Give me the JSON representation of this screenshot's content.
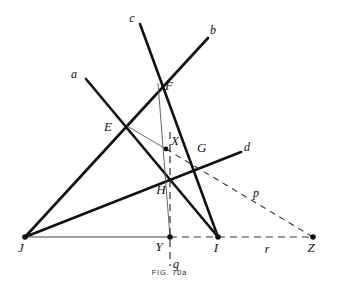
{
  "figure": {
    "caption": "FIG. 70a",
    "stroke_thick": "#111111",
    "stroke_thin": "#444444",
    "stroke_dashed": "#333333",
    "background": "#ffffff"
  },
  "points": {
    "E": {
      "label": "E",
      "x": 127,
      "y": 126,
      "label_x": 108,
      "label_y": 131,
      "dot": false
    },
    "F": {
      "label": "F",
      "x": 158,
      "y": 83,
      "label_x": 165,
      "label_y": 90,
      "dot": false
    },
    "G": {
      "label": "G",
      "x": 192,
      "y": 157,
      "label_x": 197,
      "label_y": 152,
      "dot": false
    },
    "H": {
      "label": "H",
      "x": 170,
      "y": 178,
      "label_x": 161,
      "label_y": 194,
      "dot": false
    },
    "X": {
      "label": "X",
      "x": 166,
      "y": 149,
      "label_x": 171,
      "label_y": 145,
      "dot": true
    },
    "Y": {
      "label": "Y",
      "x": 170,
      "y": 237,
      "label_x": 159,
      "label_y": 251,
      "dot": true
    },
    "I": {
      "label": "I",
      "x": 218,
      "y": 237,
      "label_x": 214,
      "label_y": 252,
      "dot": true
    },
    "J": {
      "label": "J",
      "x": 25,
      "y": 237,
      "label_x": 19,
      "label_y": 252,
      "dot": true
    },
    "Z": {
      "label": "Z",
      "x": 313,
      "y": 237,
      "label_x": 307,
      "label_y": 252,
      "dot": true
    }
  },
  "line_labels": {
    "a": {
      "label": "a",
      "x": 74,
      "y": 78
    },
    "b": {
      "label": "b",
      "x": 211,
      "y": 34
    },
    "c": {
      "label": "c",
      "x": 132,
      "y": 22
    },
    "d": {
      "label": "d",
      "x": 245,
      "y": 151
    },
    "p": {
      "label": "p",
      "x": 254,
      "y": 196
    },
    "q": {
      "label": "q",
      "x": 173,
      "y": 268
    },
    "r": {
      "label": "r",
      "x": 267,
      "y": 253
    }
  },
  "segments": {
    "line_a": {
      "name": "a",
      "x1": 86,
      "y1": 79,
      "x2": 218,
      "y2": 237,
      "width": 2.6,
      "dashed": false
    },
    "line_b": {
      "name": "b",
      "x1": 25,
      "y1": 237,
      "x2": 208,
      "y2": 38,
      "width": 2.6,
      "dashed": false
    },
    "line_c": {
      "name": "c",
      "x1": 140,
      "y1": 24,
      "x2": 218,
      "y2": 237,
      "width": 2.6,
      "dashed": false
    },
    "line_d": {
      "name": "d",
      "x1": 25,
      "y1": 237,
      "x2": 241,
      "y2": 152,
      "width": 2.6,
      "dashed": false
    },
    "seg_FY": {
      "name": "F-Y thin",
      "x1": 158,
      "y1": 83,
      "x2": 170,
      "y2": 237,
      "width": 0.9,
      "dashed": false
    },
    "seg_EX": {
      "name": "E-X thin",
      "x1": 127,
      "y1": 126,
      "x2": 166,
      "y2": 149,
      "width": 0.9,
      "dashed": false
    },
    "seg_JZ": {
      "name": "J-Y base thin",
      "x1": 25,
      "y1": 237,
      "x2": 170,
      "y2": 237,
      "width": 1.0,
      "dashed": false
    }
  },
  "dashed_segments": {
    "base_YZ": {
      "name": "Y to Z baseline",
      "x1": 170,
      "y1": 237,
      "x2": 313,
      "y2": 237
    },
    "line_q": {
      "name": "vertical q",
      "x1": 170,
      "y1": 132,
      "x2": 170,
      "y2": 266
    },
    "line_p": {
      "name": "X through G to Z",
      "x1": 166,
      "y1": 149,
      "x2": 313,
      "y2": 237
    }
  }
}
